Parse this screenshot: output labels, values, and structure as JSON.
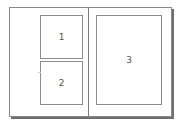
{
  "diagram": {
    "left_page": {
      "panels": [
        {
          "label": "1"
        },
        {
          "label": "2"
        }
      ]
    },
    "right_page": {
      "panels": [
        {
          "label": "3"
        }
      ]
    }
  }
}
